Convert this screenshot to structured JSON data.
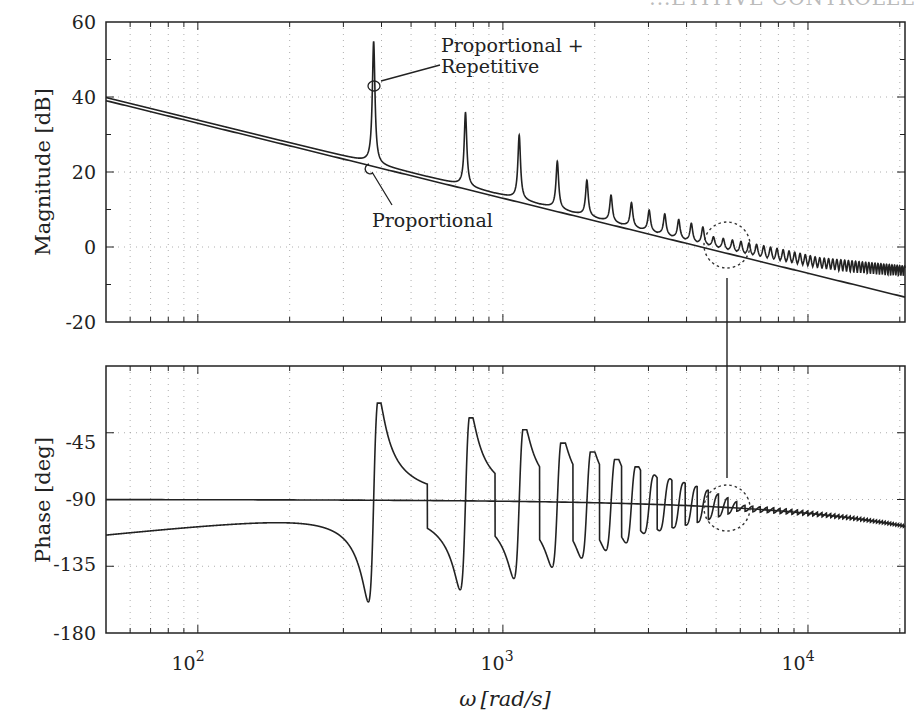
{
  "header": {
    "text": "...ETITIVE CONTROLLE"
  },
  "chart_data": [
    {
      "type": "line",
      "panel": "magnitude",
      "title": "",
      "xlabel": "",
      "ylabel": "Magnitude [dB]",
      "xscale": "log",
      "xlim": [
        50,
        20800
      ],
      "ylim": [
        -20,
        60
      ],
      "yticks": [
        -20,
        0,
        20,
        40,
        60
      ],
      "ytick_labels": [
        "-20",
        "0",
        "20",
        "40",
        "60"
      ],
      "grid": true,
      "series": [
        {
          "name": "Proportional",
          "description": "straight line with -20 dB/decade slope",
          "points": [
            [
              50,
              39
            ],
            [
              100,
              33
            ],
            [
              1000,
              13
            ],
            [
              10000,
              -7
            ],
            [
              20800,
              -13.4
            ]
          ]
        },
        {
          "name": "Proportional + Repetitive",
          "description": "proportional line plus resonant peaks at harmonics of ~377 rad/s",
          "fundamental_rad_s": 377,
          "peaks": [
            [
              377,
              55
            ],
            [
              754,
              36
            ],
            [
              1131,
              30
            ],
            [
              1508,
              23
            ],
            [
              1885,
              18
            ],
            [
              2262,
              14
            ],
            [
              2639,
              12
            ],
            [
              3016,
              10
            ],
            [
              3393,
              9
            ],
            [
              3770,
              7.5
            ],
            [
              4147,
              6.5
            ],
            [
              4524,
              5.5
            ]
          ],
          "baseline_offset_db": 1.2
        }
      ],
      "annotations": [
        {
          "text": "Proportional +",
          "line2": "Repetitive",
          "x": 377,
          "y": 43
        },
        {
          "text": "Proportional",
          "x": 377,
          "y": 21
        },
        {
          "type": "dashed-circle",
          "x": 5600,
          "y": 0
        }
      ]
    },
    {
      "type": "line",
      "panel": "phase",
      "title": "",
      "xlabel": "ω [rad/s]",
      "ylabel": "Phase [deg]",
      "xscale": "log",
      "xlim": [
        50,
        20800
      ],
      "ylim": [
        -180,
        0
      ],
      "yticks": [
        -180,
        -135,
        -90,
        -45
      ],
      "ytick_labels": [
        "-180",
        "-135",
        "-90",
        "-45"
      ],
      "xticks": [
        100,
        1000,
        10000
      ],
      "xtick_labels": [
        "10",
        "10",
        "10"
      ],
      "xtick_exponents": [
        "2",
        "3",
        "4"
      ],
      "grid": true,
      "series": [
        {
          "name": "Proportional",
          "description": "nearly flat at -90 deg, rolling off to about -108 deg at high frequency",
          "points": [
            [
              50,
              -90
            ],
            [
              1000,
              -91
            ],
            [
              5000,
              -96
            ],
            [
              10000,
              -100
            ],
            [
              20800,
              -108
            ]
          ]
        },
        {
          "name": "Proportional + Repetitive",
          "description": "starts near -114 deg, rises to +/-swings at each harmonic",
          "start_value": -114,
          "swings": [
            [
              377,
              -25,
              -164
            ],
            [
              754,
              -35,
              -155
            ],
            [
              1131,
              -43,
              -147
            ],
            [
              1508,
              -52,
              -140
            ],
            [
              1885,
              -58,
              -133
            ],
            [
              2262,
              -63,
              -127
            ],
            [
              2639,
              -68,
              -121
            ]
          ]
        }
      ],
      "annotations": [
        {
          "type": "dashed-circle",
          "x": 5600,
          "y": -95
        }
      ]
    }
  ],
  "labels": {
    "mag_ylabel": "Magnitude [dB]",
    "phase_ylabel": "Phase [deg]",
    "xlabel_omega": "ω",
    "xlabel_units": "[rad/s]",
    "annot_pr_line1": "Proportional +",
    "annot_pr_line2": "Repetitive",
    "annot_p": "Proportional",
    "mag_ticks": [
      "60",
      "40",
      "20",
      "0",
      "-20"
    ],
    "phase_ticks": [
      "-45",
      "-90",
      "-135",
      "-180"
    ],
    "x_base": "10",
    "x_exp": [
      "2",
      "3",
      "4"
    ]
  }
}
